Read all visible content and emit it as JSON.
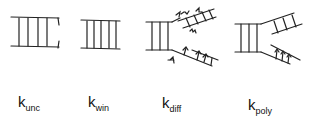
{
  "figure": {
    "panels": [
      {
        "id": "unc",
        "description": "ladder with open end (broken ends)",
        "label": {
          "main": "k",
          "sub": "unc"
        }
      },
      {
        "id": "win",
        "description": "closed ladder",
        "label": {
          "main": "k",
          "sub": "win"
        }
      },
      {
        "id": "diff",
        "description": "ladder splitting into two branches with diffusing strands (arrows)",
        "label": {
          "main": "k",
          "sub": "diff"
        }
      },
      {
        "id": "poly",
        "description": "ladder splitting into two branches with polymerization arrows",
        "label": {
          "main": "k",
          "sub": "poly"
        }
      }
    ],
    "stroke_color": "#222222",
    "background": "#ffffff"
  }
}
